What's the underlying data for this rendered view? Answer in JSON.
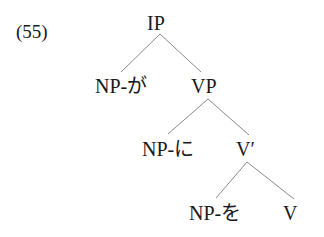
{
  "example_number": "(55)",
  "tree": {
    "root": "IP",
    "ip_children": [
      "NP-が",
      "VP"
    ],
    "vp_children": [
      "NP-に",
      "V′"
    ],
    "vbar_children": [
      "NP-を",
      "V"
    ]
  },
  "colors": {
    "text": "#1a1a1a",
    "edges": "#8a8a8a",
    "background": "#ffffff"
  }
}
